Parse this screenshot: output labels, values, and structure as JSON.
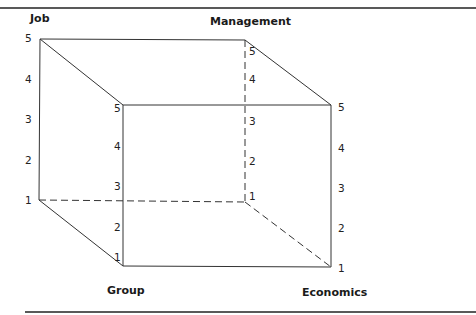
{
  "diagram": {
    "type": "cube",
    "axes": {
      "job": {
        "label": "Job",
        "ticks": [
          "5",
          "4",
          "3",
          "2",
          "1"
        ]
      },
      "management": {
        "label": "Management",
        "ticks": [
          "5",
          "4",
          "3",
          "2",
          "1"
        ]
      },
      "group": {
        "label": "Group",
        "ticks": [
          "5",
          "4",
          "3",
          "2",
          "1"
        ]
      },
      "economics": {
        "label": "Economics",
        "ticks": [
          "5",
          "4",
          "3",
          "2",
          "1"
        ]
      }
    },
    "colors": {
      "line": "#333333",
      "text": "#1a1a1a",
      "background": "#ffffff"
    }
  }
}
